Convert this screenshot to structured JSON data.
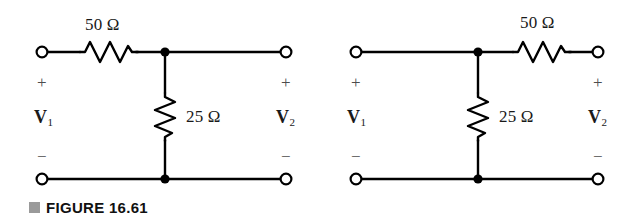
{
  "figure": {
    "caption_marker": "square-bullet",
    "caption": "FIGURE 16.61",
    "background_color": "#ffffff",
    "line_color": "#000000"
  },
  "circuits": [
    {
      "id": "left-circuit",
      "topology": "L-network (series resistor then shunt resistor)",
      "series_resistor": {
        "label": "50 Ω",
        "value": 50,
        "unit": "Ω",
        "orientation": "horizontal",
        "position": "top-left-branch"
      },
      "shunt_resistor": {
        "label": "25 Ω",
        "value": 25,
        "unit": "Ω",
        "orientation": "vertical",
        "position": "middle-shunt"
      },
      "input_port": {
        "voltage_label": "V",
        "voltage_subscript": "1",
        "plus_sign": "+",
        "minus_sign": "−"
      },
      "output_port": {
        "voltage_label": "V",
        "voltage_subscript": "2",
        "plus_sign": "+",
        "minus_sign": "−"
      }
    },
    {
      "id": "right-circuit",
      "topology": "Reversed L-network (shunt resistor then series resistor)",
      "series_resistor": {
        "label": "50 Ω",
        "value": 50,
        "unit": "Ω",
        "orientation": "horizontal",
        "position": "top-right-branch"
      },
      "shunt_resistor": {
        "label": "25 Ω",
        "value": 25,
        "unit": "Ω",
        "orientation": "vertical",
        "position": "middle-shunt"
      },
      "input_port": {
        "voltage_label": "V",
        "voltage_subscript": "1",
        "plus_sign": "+",
        "minus_sign": "−"
      },
      "output_port": {
        "voltage_label": "V",
        "voltage_subscript": "2",
        "plus_sign": "+",
        "minus_sign": "−"
      }
    }
  ]
}
